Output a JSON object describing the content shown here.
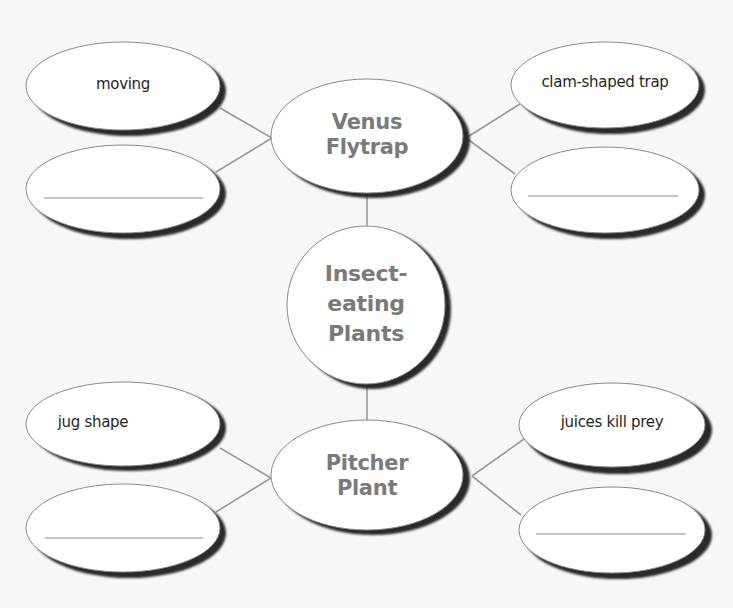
{
  "diagram": {
    "type": "concept-map",
    "colors": {
      "background": "#f7f7f7",
      "ellipse_fill": "#ffffff",
      "ellipse_stroke": "#8a8a8a",
      "shadow": "#2a2a2a",
      "connector": "#9a9a9a",
      "hub_text": "#7a7a7a",
      "leaf_text": "#1f1f1f"
    },
    "center": {
      "label": "Insect-\neating\nPlants"
    },
    "branches": [
      {
        "label": "Venus\nFlytrap",
        "details": [
          {
            "label": "moving",
            "blank": false
          },
          {
            "label": "",
            "blank": true
          },
          {
            "label": "clam-shaped trap",
            "blank": false
          },
          {
            "label": "",
            "blank": true
          }
        ]
      },
      {
        "label": "Pitcher\nPlant",
        "details": [
          {
            "label": "jug shape",
            "blank": false
          },
          {
            "label": "",
            "blank": true
          },
          {
            "label": "juices kill prey",
            "blank": false
          },
          {
            "label": "",
            "blank": true
          }
        ]
      }
    ]
  }
}
